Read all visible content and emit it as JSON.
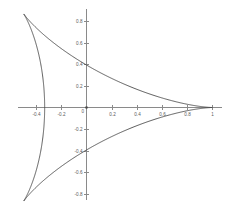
{
  "figure": {
    "title": "",
    "background_color": "#ffffff",
    "axis_color": "#8a8a8a",
    "curve_color": "#4a4a4a",
    "label_color": "#5a5a5a"
  },
  "chart_data": {
    "type": "line",
    "title": "",
    "subtitle": "",
    "xlabel": "",
    "ylabel": "",
    "curve_name": "deltoid",
    "grid": false,
    "legend": "none",
    "xlim": [
      -0.62,
      1.09
    ],
    "ylim": [
      -0.97,
      0.97
    ],
    "xticks": [
      -0.4,
      -0.2,
      0,
      0.2,
      0.4,
      0.6,
      0.8,
      1
    ],
    "xticklabels": [
      "-0.4",
      "-0.2",
      "0",
      "0.2",
      "0.4",
      "0.6",
      "0.8",
      "1"
    ],
    "yticks": [
      0.8,
      0.6,
      0.4,
      0.2,
      -0.2,
      -0.4,
      -0.6,
      -0.8
    ],
    "yticklabels": [
      "0.8",
      "0.6",
      "0.4",
      "0.2",
      "-0.2",
      "-0.4",
      "-0.6",
      "-0.8"
    ],
    "origin_label": "0",
    "cusps": [
      {
        "x": 1.0,
        "y": 0.0
      },
      {
        "x": -0.5,
        "y": 0.866
      },
      {
        "x": -0.5,
        "y": -0.866
      }
    ],
    "y_axis_crossings": [
      0.4,
      -0.4
    ],
    "x_axis_crossing_left": -0.333,
    "parametric": {
      "x": "(2*cos(t) + cos(2*t))/3",
      "y": "(2*sin(t) - sin(2*t))/3",
      "t_range": [
        0,
        6.283185307179586
      ]
    },
    "series": [
      {
        "name": "deltoid",
        "x": [
          1,
          0.9931,
          0.9727,
          0.9397,
          0.8952,
          0.8406,
          0.7777,
          0.7083,
          0.6344,
          0.5581,
          0.4814,
          0.4063,
          0.3345,
          0.2676,
          0.2069,
          0.1534,
          0.1077,
          0.0702,
          0.0408,
          0.0192,
          0.0047,
          -0.0038,
          -0.0074,
          -0.0074,
          -0.0049,
          -0.0011,
          0.0031,
          0.0067,
          0.0087,
          0.0082,
          0.0044,
          -0.0034,
          -0.0157,
          -0.0329,
          -0.0554,
          -0.0833,
          -0.1166,
          -0.1553,
          -0.1991,
          -0.2476,
          -0.3004,
          -0.3567,
          -0.4158,
          -0.4766,
          -0.5382,
          -0.5993,
          -0.6586,
          -0.7148,
          -0.7664,
          -0.812,
          -0.8501,
          -0.8794,
          -0.8985,
          -0.9063,
          -0.9018,
          -0.8842,
          -0.853,
          -0.8079,
          -0.749,
          -0.6766,
          -0.5916,
          -0.5
        ],
        "y": [
          0,
          0.0219,
          0.0434,
          0.0642,
          0.0839,
          0.1023,
          0.119,
          0.1338,
          0.1465,
          0.1569,
          0.1648,
          0.1701,
          0.1729,
          0.173,
          0.1706,
          0.1657,
          0.1585,
          0.1492,
          0.1379,
          0.125,
          0.1107,
          0.0953,
          0.0791,
          0.0625,
          0.0459,
          0.0295,
          0.0138,
          -0.0009,
          -0.0143,
          -0.0261,
          -0.036,
          -0.0437,
          -0.0491,
          -0.0519,
          -0.052,
          -0.0493,
          -0.0437,
          -0.0352,
          -0.0238,
          -0.0095,
          0.0075,
          0.0271,
          0.049,
          0.0731,
          0.099,
          0.1265,
          0.1552,
          0.1847,
          0.2147,
          0.2446,
          0.2742,
          0.3029,
          0.3304,
          0.3562,
          0.3799,
          0.4012,
          0.4197,
          0.4351,
          0.4471,
          0.4556,
          0.4603,
          0.4613
        ]
      }
    ]
  }
}
